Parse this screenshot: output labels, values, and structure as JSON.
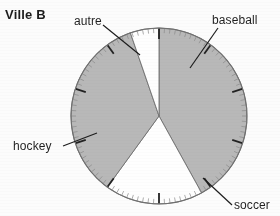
{
  "title": "Ville B",
  "labels": {
    "autre": "autre",
    "baseball": "baseball",
    "hockey": "hockey",
    "soccer": "soccer"
  },
  "colors": {
    "filled_sector": "#b8b8b8",
    "empty_sector": "#ffffff",
    "outline": "#6e6e6e",
    "tick": "#8a8a8a",
    "major_tick": "#1f1f1f",
    "text": "#1d1d1d",
    "leader_line": "#1a1a1a"
  },
  "chart_data": {
    "type": "pie",
    "title": "Ville B",
    "xlabel": "",
    "ylabel": "",
    "grid": false,
    "legend_position": "callout-labels",
    "units": "percent",
    "total": 100,
    "start_angle_deg": 0,
    "direction": "clockwise",
    "tick_divisions": 100,
    "major_tick_every": 10,
    "categories": [
      "baseball",
      "soccer",
      "hockey",
      "autre"
    ],
    "values": [
      42,
      18,
      35,
      5
    ],
    "slices": [
      {
        "label": "baseball",
        "value": 42,
        "shaded": true,
        "start_deg": 0,
        "end_deg": 151
      },
      {
        "label": "soccer",
        "value": 18,
        "shaded": false,
        "start_deg": 151,
        "end_deg": 216
      },
      {
        "label": "hockey",
        "value": 35,
        "shaded": true,
        "start_deg": 216,
        "end_deg": 341
      },
      {
        "label": "autre",
        "value": 5,
        "shaded": false,
        "start_deg": 341,
        "end_deg": 360
      }
    ]
  },
  "geometry": {
    "center_x": 159,
    "center_y": 116,
    "radius": 88
  }
}
